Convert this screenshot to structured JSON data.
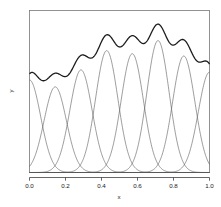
{
  "chart_data": {
    "type": "line",
    "title": "",
    "xlabel": "x",
    "ylabel": "y",
    "xlim": [
      0.0,
      1.0
    ],
    "ylim": [
      0.0,
      1.05
    ],
    "grid": false,
    "legend": null,
    "xticks": [
      "0.0",
      "0.2",
      "0.4",
      "0.6",
      "0.8",
      "1.0"
    ],
    "xtick_values": [
      0.0,
      0.2,
      0.4,
      0.6,
      0.8,
      1.0
    ],
    "yticks": [],
    "basis": {
      "kind": "gaussian",
      "sigma": 0.062,
      "count": 8,
      "centers": [
        0.0,
        0.143,
        0.286,
        0.429,
        0.571,
        0.714,
        0.857,
        1.0
      ],
      "weights": [
        0.6,
        0.555,
        0.665,
        0.79,
        0.77,
        0.855,
        0.755,
        0.65
      ]
    },
    "series": [
      {
        "name": "basis-1",
        "center": 0.0,
        "weight": 0.6,
        "peak_y": 0.6
      },
      {
        "name": "basis-2",
        "center": 0.143,
        "weight": 0.555,
        "peak_y": 0.555
      },
      {
        "name": "basis-3",
        "center": 0.286,
        "weight": 0.665,
        "peak_y": 0.665
      },
      {
        "name": "basis-4",
        "center": 0.429,
        "weight": 0.79,
        "peak_y": 0.79
      },
      {
        "name": "basis-5",
        "center": 0.571,
        "weight": 0.77,
        "peak_y": 0.77
      },
      {
        "name": "basis-6",
        "center": 0.714,
        "weight": 0.855,
        "peak_y": 0.855
      },
      {
        "name": "basis-7",
        "center": 0.857,
        "weight": 0.755,
        "peak_y": 0.755
      },
      {
        "name": "basis-8",
        "center": 1.0,
        "weight": 0.65,
        "peak_y": 0.65
      },
      {
        "name": "sum-curve",
        "is_sum": true,
        "start_y": 0.605,
        "peak_x": 0.7,
        "peak_y": 0.93,
        "end_y": 0.76
      }
    ],
    "colors": {
      "basis_line": "#5a5a5a",
      "sum_line": "#1c1c1c",
      "axis": "#404040",
      "box": "#666666",
      "background": "#ffffff"
    }
  },
  "axes": {
    "x_title": "x",
    "y_title": "y"
  }
}
